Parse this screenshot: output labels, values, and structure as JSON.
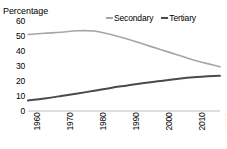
{
  "chart_data": {
    "type": "line",
    "title": "",
    "ylabel": "Percentage",
    "xlabel": "",
    "ylim": [
      0,
      60
    ],
    "grid": false,
    "legend_position": "top-right",
    "y_ticks": [
      "60",
      "50",
      "40",
      "30",
      "20",
      "10",
      "0"
    ],
    "x": [
      1960,
      1970,
      1980,
      1990,
      2000,
      2010,
      2018
    ],
    "categories": [
      "1960",
      "1970",
      "1980",
      "1990",
      "2000",
      "2010",
      "2018"
    ],
    "series": [
      {
        "name": "Secondary",
        "color": "#a6a6a6",
        "values": [
          51,
          52.5,
          53.5,
          48,
          41,
          34,
          29.5
        ],
        "points": [
          {
            "x": 1960,
            "y": 51
          },
          {
            "x": 1965,
            "y": 51.8
          },
          {
            "x": 1970,
            "y": 52.5
          },
          {
            "x": 1975,
            "y": 53.5
          },
          {
            "x": 1980,
            "y": 53.3
          },
          {
            "x": 1985,
            "y": 51
          },
          {
            "x": 1990,
            "y": 48
          },
          {
            "x": 1995,
            "y": 44.5
          },
          {
            "x": 2000,
            "y": 41
          },
          {
            "x": 2005,
            "y": 37.5
          },
          {
            "x": 2010,
            "y": 34
          },
          {
            "x": 2018,
            "y": 29.5
          }
        ]
      },
      {
        "name": "Tertiary",
        "color": "#4a4a4a",
        "values": [
          7,
          10,
          13.5,
          17,
          20,
          22.5,
          23.5
        ],
        "points": [
          {
            "x": 1960,
            "y": 7
          },
          {
            "x": 1965,
            "y": 8.4
          },
          {
            "x": 1970,
            "y": 10
          },
          {
            "x": 1975,
            "y": 11.7
          },
          {
            "x": 1980,
            "y": 13.5
          },
          {
            "x": 1985,
            "y": 15.4
          },
          {
            "x": 1990,
            "y": 17
          },
          {
            "x": 1995,
            "y": 18.6
          },
          {
            "x": 2000,
            "y": 20
          },
          {
            "x": 2005,
            "y": 21.4
          },
          {
            "x": 2010,
            "y": 22.5
          },
          {
            "x": 2018,
            "y": 23.5
          }
        ]
      }
    ],
    "baseline_color": "#bfbfbf"
  },
  "legend": {
    "items": [
      {
        "label": "Secondary"
      },
      {
        "label": "Tertiary"
      }
    ]
  }
}
